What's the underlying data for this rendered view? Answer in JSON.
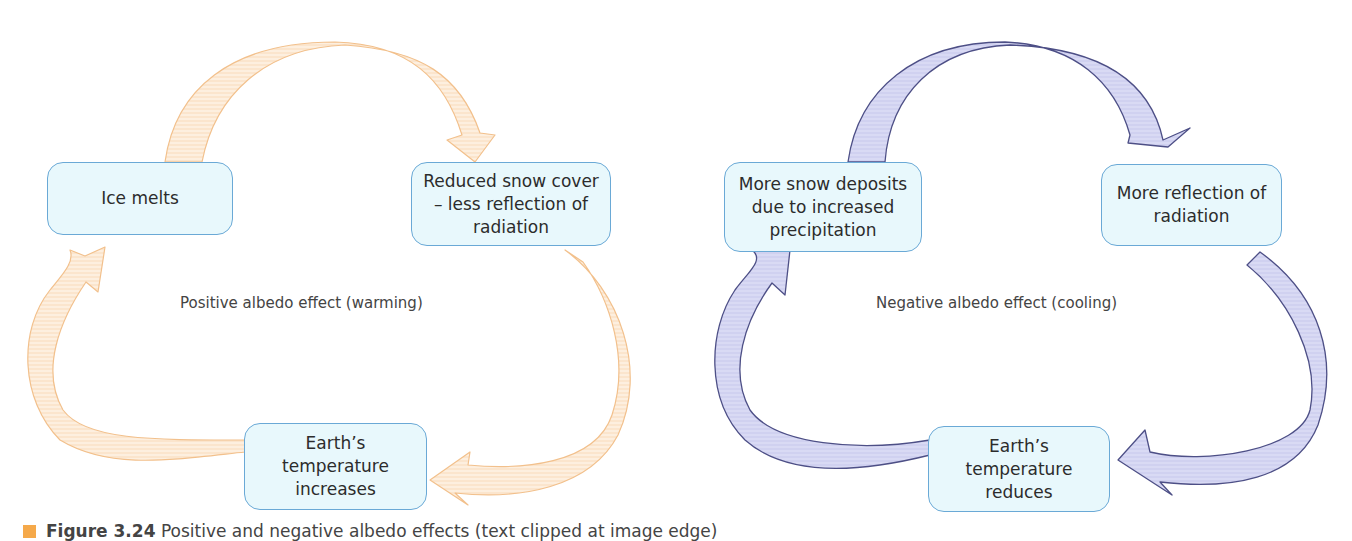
{
  "colors": {
    "box_fill": "#e8f8fc",
    "box_border": "#6aa9d6",
    "positive_arrow_fill": "#fdebd6",
    "positive_arrow_stroke": "#f2c08c",
    "negative_arrow_fill": "#d6d7f3",
    "negative_arrow_stroke": "#4d4f86",
    "caption_bullet": "#f5a94a"
  },
  "left_diagram": {
    "label": "Positive albedo effect (warming)",
    "boxes": {
      "top_left": "Ice melts",
      "top_right": "Reduced snow cover – less reflection of radiation",
      "bottom": "Earth’s temperature increases"
    }
  },
  "right_diagram": {
    "label": "Negative albedo effect (cooling)",
    "boxes": {
      "top_left": "More snow deposits due to increased precipitation",
      "top_right": "More reflection of radiation",
      "bottom": "Earth’s temperature reduces"
    }
  },
  "caption": {
    "prefix": "Figure 3.24",
    "text": " Positive and negative albedo effects (text clipped at image edge)"
  }
}
